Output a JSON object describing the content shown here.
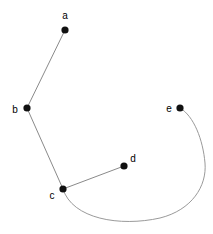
{
  "diagram": {
    "type": "node-link-graph",
    "background_color": "#ffffff",
    "width": 213,
    "height": 234,
    "node_color": "#111111",
    "edge_color": "#8a8a8a",
    "label_color": "#000000",
    "node_radius": 3.6,
    "nodes": [
      {
        "id": "a",
        "label": "a",
        "x": 65,
        "y": 30,
        "label_x": 65,
        "label_y": 16,
        "label_anchor": "middle"
      },
      {
        "id": "b",
        "label": "b",
        "x": 27,
        "y": 108,
        "label_x": 15,
        "label_y": 110,
        "label_anchor": "middle"
      },
      {
        "id": "c",
        "label": "c",
        "x": 63,
        "y": 189,
        "label_x": 52,
        "label_y": 196,
        "label_anchor": "middle"
      },
      {
        "id": "d",
        "label": "d",
        "x": 124,
        "y": 166,
        "label_x": 133,
        "label_y": 159,
        "label_anchor": "middle"
      },
      {
        "id": "e",
        "label": "e",
        "x": 180,
        "y": 108,
        "label_x": 169,
        "label_y": 109,
        "label_anchor": "middle"
      }
    ],
    "edges": [
      {
        "id": "a-b",
        "from": "a",
        "to": "b",
        "shape": "line",
        "path": "M 65 30 L 27 108"
      },
      {
        "id": "b-c",
        "from": "b",
        "to": "c",
        "shape": "line",
        "path": "M 27 108 L 63 189"
      },
      {
        "id": "c-d",
        "from": "c",
        "to": "d",
        "shape": "line",
        "path": "M 63 189 L 124 166"
      },
      {
        "id": "c-e",
        "from": "c",
        "to": "e",
        "shape": "curve",
        "path": "M 63 189 C 72 219, 120 227, 160 218 C 192 210, 207 186, 205 163 C 203 140, 194 116, 180 108"
      }
    ]
  }
}
